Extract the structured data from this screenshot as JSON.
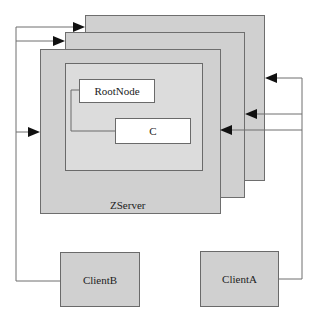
{
  "diagram": {
    "server_label": "ZServer",
    "nodes": {
      "root": "RootNode",
      "child": "C"
    },
    "clients": {
      "b": "ClientB",
      "a": "ClientA"
    },
    "colors": {
      "frame_fill": "#d0d0d0",
      "inner_fill": "#dcdcdc",
      "node_fill": "#ffffff",
      "line": "#6e6e6e",
      "arrow": "#111111"
    }
  }
}
